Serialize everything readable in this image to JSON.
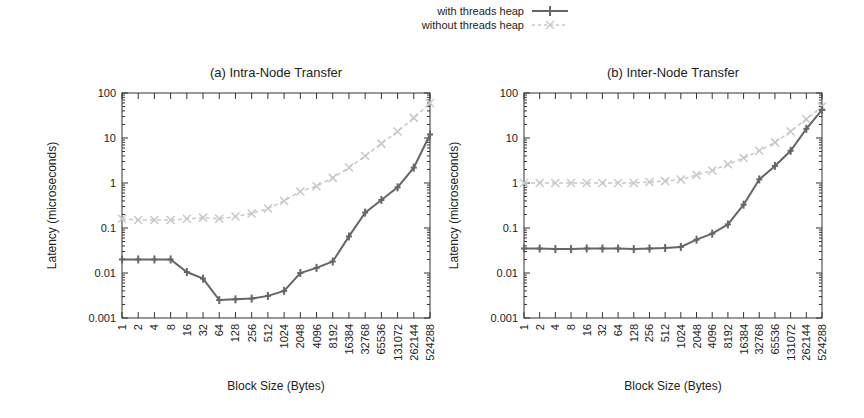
{
  "legend": {
    "items": [
      {
        "label": "with threads heap",
        "color": "#666666",
        "style": "solid",
        "marker": "plus"
      },
      {
        "label": "without threads heap",
        "color": "#c8c8c8",
        "style": "dashed",
        "marker": "cross"
      }
    ]
  },
  "chart_data": [
    {
      "type": "line",
      "title": "(a) Intra-Node Transfer",
      "xlabel": "Block Size (Bytes)",
      "ylabel": "Latency (microseconds)",
      "yscale": "log",
      "ylim": [
        0.001,
        100
      ],
      "yticks": [
        "0.001",
        "0.01",
        "0.1",
        "1",
        "10",
        "100"
      ],
      "x": [
        1,
        2,
        4,
        8,
        16,
        32,
        64,
        128,
        256,
        512,
        1024,
        2048,
        4096,
        8192,
        16384,
        32768,
        65536,
        131072,
        262144,
        524288
      ],
      "xtick_labels": [
        "1",
        "2",
        "4",
        "8",
        "16",
        "32",
        "64",
        "128",
        "256",
        "512",
        "1024",
        "2048",
        "4096",
        "8192",
        "16384",
        "32768",
        "65536",
        "131072",
        "262144",
        "524288"
      ],
      "series": [
        {
          "name": "with threads heap",
          "values": [
            0.02,
            0.02,
            0.02,
            0.02,
            0.0105,
            0.0075,
            0.0025,
            0.0026,
            0.0027,
            0.0031,
            0.004,
            0.01,
            0.013,
            0.018,
            0.065,
            0.22,
            0.42,
            0.8,
            2.2,
            12
          ]
        },
        {
          "name": "without threads heap",
          "values": [
            0.16,
            0.15,
            0.15,
            0.15,
            0.16,
            0.17,
            0.16,
            0.18,
            0.21,
            0.27,
            0.4,
            0.65,
            0.85,
            1.3,
            2.2,
            4,
            7.5,
            14,
            28,
            60
          ]
        }
      ],
      "grid": false,
      "legend_position": "top-center"
    },
    {
      "type": "line",
      "title": "(b) Inter-Node Transfer",
      "xlabel": "Block Size (Bytes)",
      "ylabel": "Latency (microseconds)",
      "yscale": "log",
      "ylim": [
        0.001,
        100
      ],
      "yticks": [
        "0.001",
        "0.01",
        "0.1",
        "1",
        "10",
        "100"
      ],
      "x": [
        1,
        2,
        4,
        8,
        16,
        32,
        64,
        128,
        256,
        512,
        1024,
        2048,
        4096,
        8192,
        16384,
        32768,
        65536,
        131072,
        262144,
        524288
      ],
      "xtick_labels": [
        "1",
        "2",
        "4",
        "8",
        "16",
        "32",
        "64",
        "128",
        "256",
        "512",
        "1024",
        "2048",
        "4096",
        "8192",
        "16384",
        "32768",
        "65536",
        "131072",
        "262144",
        "524288"
      ],
      "series": [
        {
          "name": "with threads heap",
          "values": [
            0.035,
            0.035,
            0.034,
            0.034,
            0.035,
            0.035,
            0.035,
            0.034,
            0.035,
            0.036,
            0.038,
            0.055,
            0.075,
            0.12,
            0.33,
            1.2,
            2.4,
            5.2,
            16,
            42
          ]
        },
        {
          "name": "without threads heap",
          "values": [
            1.0,
            1.0,
            1.0,
            1.0,
            1.0,
            1.0,
            1.0,
            1.0,
            1.05,
            1.1,
            1.2,
            1.5,
            1.9,
            2.6,
            3.6,
            5.2,
            8,
            14,
            26,
            50
          ]
        }
      ],
      "grid": false,
      "legend_position": "top-center"
    }
  ]
}
